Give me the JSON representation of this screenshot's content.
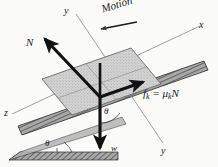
{
  "figure": {
    "background_color": "#fbfbfa",
    "ink_color": "#1a1a1a",
    "block_fill": "#cfcfcf",
    "incline_fill": "#9a9a9a",
    "axis_color": "#7a7a7a"
  },
  "labels": {
    "axis_y_top": "y",
    "axis_x_right": "x",
    "axis_z_left": "z",
    "axis_y_bottom": "y",
    "normal_force": "N",
    "weight": "w",
    "friction_force_f": "f",
    "friction_force_sub1": "k",
    "friction_force_eq": " = ",
    "friction_force_mu": "μ",
    "friction_force_sub2": "k",
    "friction_force_N": "N",
    "motion": "Motion",
    "theta_incline": "θ",
    "theta_inner": "θ"
  },
  "geometry": {
    "origin_x": 100,
    "origin_y": 97,
    "incline_angle_deg": 19,
    "normal_arrow_tip": [
      42,
      36
    ],
    "weight_arrow_tip": [
      100,
      151
    ],
    "friction_arrow_tip": [
      146,
      80
    ],
    "motion_arrow_from": [
      137,
      22
    ],
    "motion_arrow_to": [
      101,
      28
    ]
  }
}
